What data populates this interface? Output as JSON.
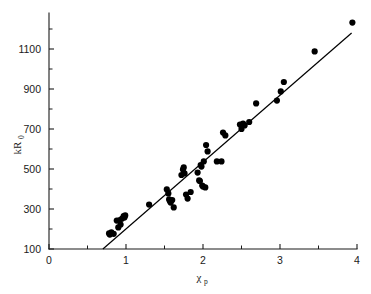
{
  "chart_data": {
    "type": "scatter",
    "title": "",
    "subtitle": "",
    "xlabel": "χ",
    "xlabel_sub": "p",
    "ylabel": "kR",
    "ylabel_sub": "0",
    "xlim": [
      0,
      4
    ],
    "ylim": [
      100,
      1250
    ],
    "x_ticks": [
      0,
      1,
      2,
      3,
      4
    ],
    "x_tick_labels": [
      "0",
      "1",
      "2",
      "3",
      "4"
    ],
    "x_minor_ticks": [
      0.5,
      1.5,
      2.5,
      3.5
    ],
    "y_ticks": [
      100,
      300,
      500,
      700,
      900,
      1100
    ],
    "y_tick_labels": [
      "100",
      "300",
      "500",
      "700",
      "900",
      "1100"
    ],
    "y_minor_ticks": [
      200,
      400,
      600,
      800,
      1000,
      1200
    ],
    "grid": false,
    "legend": null,
    "marker": "filled-circle",
    "marker_color": "#000000",
    "marker_size": 4.4,
    "points": [
      [
        0.78,
        178
      ],
      [
        0.79,
        172
      ],
      [
        0.81,
        183
      ],
      [
        0.84,
        176
      ],
      [
        0.88,
        242
      ],
      [
        0.9,
        208
      ],
      [
        0.92,
        245
      ],
      [
        0.93,
        222
      ],
      [
        0.95,
        252
      ],
      [
        0.97,
        265
      ],
      [
        0.98,
        258
      ],
      [
        0.99,
        268
      ],
      [
        1.3,
        322
      ],
      [
        1.53,
        398
      ],
      [
        1.55,
        378
      ],
      [
        1.56,
        348
      ],
      [
        1.57,
        340
      ],
      [
        1.58,
        332
      ],
      [
        1.6,
        345
      ],
      [
        1.62,
        308
      ],
      [
        1.72,
        470
      ],
      [
        1.74,
        497
      ],
      [
        1.75,
        508
      ],
      [
        1.76,
        478
      ],
      [
        1.78,
        372
      ],
      [
        1.8,
        352
      ],
      [
        1.84,
        385
      ],
      [
        1.93,
        482
      ],
      [
        1.95,
        443
      ],
      [
        1.96,
        440
      ],
      [
        1.97,
        520
      ],
      [
        1.98,
        512
      ],
      [
        1.99,
        417
      ],
      [
        2.0,
        412
      ],
      [
        2.01,
        538
      ],
      [
        2.03,
        408
      ],
      [
        2.04,
        620
      ],
      [
        2.06,
        588
      ],
      [
        2.18,
        538
      ],
      [
        2.24,
        538
      ],
      [
        2.26,
        682
      ],
      [
        2.29,
        668
      ],
      [
        2.48,
        722
      ],
      [
        2.5,
        700
      ],
      [
        2.52,
        727
      ],
      [
        2.54,
        718
      ],
      [
        2.6,
        735
      ],
      [
        2.69,
        828
      ],
      [
        2.96,
        842
      ],
      [
        3.01,
        888
      ],
      [
        3.05,
        935
      ],
      [
        3.45,
        1088
      ],
      [
        3.94,
        1232
      ]
    ],
    "fit_line": {
      "type": "linear",
      "x_start": 0.7,
      "y_start": 100,
      "x_end": 3.93,
      "y_end": 1180
    }
  },
  "axes": {
    "y_axis_name": "kR0-axis",
    "x_axis_name": "chi-p-axis"
  }
}
